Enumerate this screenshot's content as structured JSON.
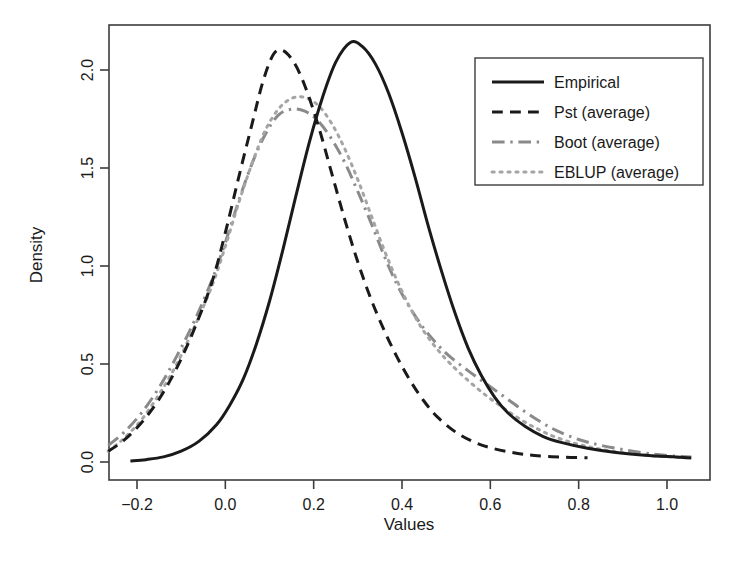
{
  "chart_data": {
    "type": "line",
    "title": "",
    "xlabel": "Values",
    "ylabel": "Density",
    "xlim": [
      -0.27,
      1.06
    ],
    "ylim": [
      -0.05,
      2.25
    ],
    "xticks": [
      -0.2,
      0.0,
      0.2,
      0.4,
      0.6,
      0.8,
      1.0
    ],
    "xticklabels": [
      "-0.2",
      "0.0",
      "0.2",
      "0.4",
      "0.6",
      "0.8",
      "1.0"
    ],
    "yticks": [
      0.0,
      0.5,
      1.0,
      1.5,
      2.0
    ],
    "yticklabels": [
      "0.0",
      "0.5",
      "1.0",
      "1.5",
      "2.0"
    ],
    "grid": false,
    "legend_position": "top-right",
    "series": [
      {
        "name": "Empirical",
        "linestyle": "solid",
        "color": "#1a1a1a",
        "width": 3.0,
        "points": [
          [
            -0.215,
            0.005
          ],
          [
            -0.18,
            0.012
          ],
          [
            -0.14,
            0.026
          ],
          [
            -0.1,
            0.055
          ],
          [
            -0.06,
            0.105
          ],
          [
            -0.02,
            0.19
          ],
          [
            0.01,
            0.29
          ],
          [
            0.04,
            0.42
          ],
          [
            0.07,
            0.6
          ],
          [
            0.1,
            0.82
          ],
          [
            0.13,
            1.08
          ],
          [
            0.16,
            1.36
          ],
          [
            0.19,
            1.63
          ],
          [
            0.22,
            1.86
          ],
          [
            0.25,
            2.04
          ],
          [
            0.283,
            2.14
          ],
          [
            0.31,
            2.12
          ],
          [
            0.34,
            2.03
          ],
          [
            0.37,
            1.88
          ],
          [
            0.4,
            1.68
          ],
          [
            0.43,
            1.45
          ],
          [
            0.46,
            1.2
          ],
          [
            0.49,
            0.97
          ],
          [
            0.52,
            0.76
          ],
          [
            0.55,
            0.58
          ],
          [
            0.58,
            0.44
          ],
          [
            0.61,
            0.33
          ],
          [
            0.64,
            0.25
          ],
          [
            0.68,
            0.18
          ],
          [
            0.72,
            0.13
          ],
          [
            0.76,
            0.1
          ],
          [
            0.82,
            0.07
          ],
          [
            0.88,
            0.05
          ],
          [
            0.95,
            0.035
          ],
          [
            1.02,
            0.025
          ],
          [
            1.055,
            0.02
          ]
        ]
      },
      {
        "name": "Pst (average)",
        "linestyle": "dashed",
        "color": "#1a1a1a",
        "width": 3.0,
        "points": [
          [
            -0.265,
            0.055
          ],
          [
            -0.23,
            0.11
          ],
          [
            -0.19,
            0.2
          ],
          [
            -0.15,
            0.32
          ],
          [
            -0.11,
            0.48
          ],
          [
            -0.07,
            0.68
          ],
          [
            -0.03,
            0.92
          ],
          [
            0.0,
            1.17
          ],
          [
            0.03,
            1.45
          ],
          [
            0.06,
            1.72
          ],
          [
            0.085,
            1.94
          ],
          [
            0.109,
            2.08
          ],
          [
            0.13,
            2.1
          ],
          [
            0.155,
            2.04
          ],
          [
            0.18,
            1.92
          ],
          [
            0.21,
            1.72
          ],
          [
            0.24,
            1.48
          ],
          [
            0.27,
            1.24
          ],
          [
            0.3,
            1.02
          ],
          [
            0.33,
            0.83
          ],
          [
            0.36,
            0.67
          ],
          [
            0.39,
            0.53
          ],
          [
            0.42,
            0.41
          ],
          [
            0.45,
            0.31
          ],
          [
            0.48,
            0.23
          ],
          [
            0.52,
            0.155
          ],
          [
            0.56,
            0.105
          ],
          [
            0.6,
            0.073
          ],
          [
            0.65,
            0.048
          ],
          [
            0.7,
            0.033
          ],
          [
            0.76,
            0.025
          ],
          [
            0.82,
            0.022
          ]
        ]
      },
      {
        "name": "Boot (average)",
        "linestyle": "dashdot",
        "color": "#8a8a8a",
        "width": 3.0,
        "points": [
          [
            -0.265,
            0.085
          ],
          [
            -0.23,
            0.15
          ],
          [
            -0.19,
            0.25
          ],
          [
            -0.15,
            0.38
          ],
          [
            -0.11,
            0.54
          ],
          [
            -0.07,
            0.72
          ],
          [
            -0.03,
            0.93
          ],
          [
            0.0,
            1.12
          ],
          [
            0.03,
            1.33
          ],
          [
            0.06,
            1.52
          ],
          [
            0.09,
            1.67
          ],
          [
            0.12,
            1.77
          ],
          [
            0.15,
            1.8
          ],
          [
            0.18,
            1.79
          ],
          [
            0.21,
            1.74
          ],
          [
            0.24,
            1.65
          ],
          [
            0.27,
            1.53
          ],
          [
            0.3,
            1.38
          ],
          [
            0.33,
            1.22
          ],
          [
            0.36,
            1.05
          ],
          [
            0.39,
            0.9
          ],
          [
            0.42,
            0.78
          ],
          [
            0.45,
            0.68
          ],
          [
            0.48,
            0.6
          ],
          [
            0.51,
            0.535
          ],
          [
            0.55,
            0.465
          ],
          [
            0.59,
            0.4
          ],
          [
            0.63,
            0.335
          ],
          [
            0.67,
            0.27
          ],
          [
            0.71,
            0.21
          ],
          [
            0.75,
            0.16
          ],
          [
            0.8,
            0.115
          ],
          [
            0.85,
            0.085
          ],
          [
            0.91,
            0.06
          ],
          [
            0.97,
            0.04
          ],
          [
            1.02,
            0.03
          ],
          [
            1.055,
            0.025
          ]
        ]
      },
      {
        "name": "EBLUP (average)",
        "linestyle": "dotted",
        "color": "#a5a5a5",
        "width": 3.0,
        "points": [
          [
            -0.265,
            0.055
          ],
          [
            -0.23,
            0.12
          ],
          [
            -0.19,
            0.215
          ],
          [
            -0.15,
            0.345
          ],
          [
            -0.11,
            0.5
          ],
          [
            -0.07,
            0.69
          ],
          [
            -0.03,
            0.9
          ],
          [
            0.0,
            1.1
          ],
          [
            0.03,
            1.32
          ],
          [
            0.06,
            1.52
          ],
          [
            0.09,
            1.69
          ],
          [
            0.12,
            1.8
          ],
          [
            0.15,
            1.855
          ],
          [
            0.18,
            1.86
          ],
          [
            0.21,
            1.82
          ],
          [
            0.24,
            1.73
          ],
          [
            0.27,
            1.6
          ],
          [
            0.3,
            1.44
          ],
          [
            0.33,
            1.26
          ],
          [
            0.36,
            1.08
          ],
          [
            0.39,
            0.92
          ],
          [
            0.42,
            0.78
          ],
          [
            0.45,
            0.665
          ],
          [
            0.48,
            0.575
          ],
          [
            0.51,
            0.5
          ],
          [
            0.55,
            0.415
          ],
          [
            0.59,
            0.34
          ],
          [
            0.63,
            0.275
          ],
          [
            0.67,
            0.215
          ],
          [
            0.71,
            0.165
          ],
          [
            0.75,
            0.125
          ],
          [
            0.8,
            0.09
          ],
          [
            0.85,
            0.065
          ],
          [
            0.91,
            0.045
          ],
          [
            0.97,
            0.032
          ],
          [
            1.02,
            0.025
          ],
          [
            1.055,
            0.02
          ]
        ]
      }
    ]
  },
  "legend": {
    "entries": [
      {
        "label": "Empirical",
        "style": "solid",
        "color": "#1a1a1a"
      },
      {
        "label": "Pst (average)",
        "style": "dashed",
        "color": "#1a1a1a"
      },
      {
        "label": "Boot (average)",
        "style": "dashdot",
        "color": "#8a8a8a"
      },
      {
        "label": "EBLUP (average)",
        "style": "dotted",
        "color": "#a5a5a5"
      }
    ]
  },
  "axes": {
    "xlabel": "Values",
    "ylabel": "Density",
    "frame_color": "#3c3c3c"
  }
}
